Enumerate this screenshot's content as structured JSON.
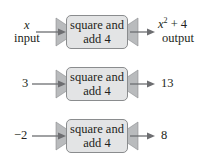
{
  "diagram": {
    "type": "function-machine",
    "function_label_line1": "square and",
    "function_label_line2": "add 4",
    "colors": {
      "box_fill": "#e3e4e5",
      "box_border": "#8a8c8e",
      "arrow": "#6d6e71",
      "text": "#231f20"
    },
    "rows": [
      {
        "input": "x",
        "input_caption": "input",
        "output_base": "x",
        "output_exp": "2",
        "output_rest": " + 4",
        "output_caption": "output"
      },
      {
        "input": "3",
        "output": "13"
      },
      {
        "input": "−2",
        "output": "8"
      }
    ]
  }
}
